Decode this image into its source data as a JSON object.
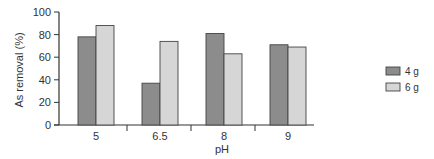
{
  "chart_data": {
    "type": "bar",
    "title": "",
    "xlabel": "pH",
    "ylabel": "As removal (%)",
    "ylim": [
      0,
      100
    ],
    "yticks": [
      0,
      20,
      40,
      60,
      80,
      100
    ],
    "categories": [
      "5",
      "6.5",
      "8",
      "9"
    ],
    "series": [
      {
        "name": "4 g",
        "color": "#8c8c8c",
        "values": [
          78,
          37,
          81,
          71
        ]
      },
      {
        "name": "6 g",
        "color": "#d6d6d6",
        "values": [
          88,
          74,
          63,
          69
        ]
      }
    ],
    "grid": false,
    "legend_position": "right"
  }
}
